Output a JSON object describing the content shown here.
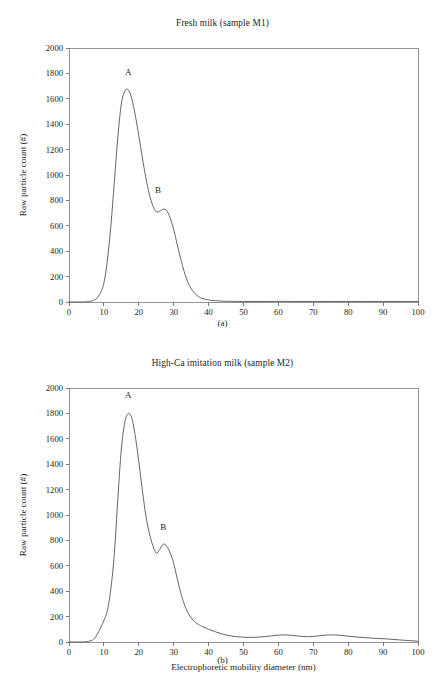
{
  "figure": {
    "panels": [
      {
        "id": "a",
        "title": "Fresh milk (sample M1)",
        "sub_label": "(a)",
        "ylabel": "Raw particle count (#)",
        "xlabel": "",
        "peak_labels": [
          {
            "text": "A",
            "x": 17,
            "y": 1790
          },
          {
            "text": "B",
            "x": 25.5,
            "y": 860
          }
        ]
      },
      {
        "id": "b",
        "title": "High-Ca imitation milk (sample M2)",
        "sub_label": "(b)",
        "ylabel": "Raw particle count (#)",
        "xlabel": "Electrophoretic mobility diameter (nm)",
        "peak_labels": [
          {
            "text": "A",
            "x": 17,
            "y": 1920
          },
          {
            "text": "B",
            "x": 27,
            "y": 880
          }
        ]
      }
    ]
  },
  "chart_data": [
    {
      "type": "line",
      "panel": "a",
      "title": "Fresh milk (sample M1)",
      "xlabel": "Electrophoretic mobility diameter (nm)",
      "ylabel": "Raw particle count (#)",
      "xlim": [
        0,
        100
      ],
      "ylim": [
        0,
        2000
      ],
      "xticks": [
        0,
        10,
        20,
        30,
        40,
        50,
        60,
        70,
        80,
        90,
        100
      ],
      "yticks": [
        0,
        200,
        400,
        600,
        800,
        1000,
        1200,
        1400,
        1600,
        1800,
        2000
      ],
      "grid": false,
      "legend": "none",
      "line_color": "#4a4a4a",
      "annotations": [
        {
          "label": "A",
          "x": 17,
          "y": 1670,
          "note": "primary peak"
        },
        {
          "label": "B",
          "x": 25.5,
          "y": 730,
          "note": "secondary shoulder peak"
        }
      ],
      "x": [
        0,
        2,
        4,
        6,
        7,
        8,
        9,
        10,
        11,
        12,
        13,
        14,
        15,
        16,
        17,
        18,
        19,
        20,
        21,
        22,
        23,
        24,
        25,
        26,
        27,
        28,
        29,
        30,
        31,
        32,
        33,
        34,
        35,
        36,
        37,
        38,
        40,
        42,
        45,
        50,
        55,
        60,
        65,
        70,
        75,
        80,
        85,
        90,
        95,
        100
      ],
      "y": [
        0,
        0,
        0,
        5,
        12,
        30,
        70,
        150,
        330,
        600,
        950,
        1300,
        1560,
        1660,
        1670,
        1600,
        1470,
        1310,
        1140,
        980,
        850,
        760,
        710,
        715,
        730,
        720,
        660,
        570,
        455,
        340,
        240,
        160,
        105,
        68,
        45,
        30,
        16,
        10,
        6,
        4,
        4,
        5,
        4,
        4,
        4,
        4,
        4,
        4,
        4,
        4
      ]
    },
    {
      "type": "line",
      "panel": "b",
      "title": "High-Ca imitation milk (sample M2)",
      "xlabel": "Electrophoretic mobility diameter (nm)",
      "ylabel": "Raw particle count (#)",
      "xlim": [
        0,
        100
      ],
      "ylim": [
        0,
        2000
      ],
      "xticks": [
        0,
        10,
        20,
        30,
        40,
        50,
        60,
        70,
        80,
        90,
        100
      ],
      "yticks": [
        0,
        200,
        400,
        600,
        800,
        1000,
        1200,
        1400,
        1600,
        1800,
        2000
      ],
      "grid": false,
      "legend": "none",
      "line_color": "#4a4a4a",
      "annotations": [
        {
          "label": "A",
          "x": 17,
          "y": 1800,
          "note": "primary peak"
        },
        {
          "label": "B",
          "x": 27,
          "y": 770,
          "note": "secondary shoulder peak"
        }
      ],
      "x": [
        0,
        2,
        4,
        6,
        7,
        8,
        9,
        10,
        11,
        12,
        13,
        14,
        15,
        16,
        17,
        18,
        19,
        20,
        21,
        22,
        23,
        24,
        25,
        26,
        27,
        28,
        29,
        30,
        31,
        32,
        33,
        34,
        35,
        36,
        37,
        38,
        40,
        42,
        44,
        46,
        48,
        50,
        52,
        54,
        56,
        58,
        60,
        62,
        64,
        66,
        68,
        70,
        72,
        74,
        76,
        78,
        80,
        82,
        84,
        86,
        88,
        90,
        92,
        94,
        96,
        98,
        100
      ],
      "y": [
        0,
        0,
        0,
        8,
        20,
        55,
        110,
        170,
        250,
        420,
        700,
        1130,
        1520,
        1730,
        1800,
        1760,
        1620,
        1420,
        1200,
        1000,
        860,
        760,
        700,
        730,
        770,
        755,
        700,
        620,
        500,
        390,
        300,
        235,
        190,
        160,
        140,
        125,
        100,
        80,
        62,
        50,
        42,
        38,
        36,
        38,
        42,
        48,
        54,
        56,
        52,
        46,
        42,
        44,
        50,
        55,
        56,
        52,
        46,
        40,
        36,
        32,
        28,
        26,
        22,
        18,
        14,
        10,
        6
      ]
    }
  ]
}
